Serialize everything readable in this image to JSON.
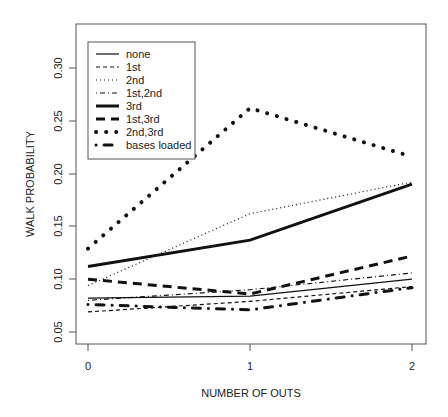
{
  "chart_data": {
    "type": "line",
    "title": "",
    "xlabel": "NUMBER OF OUTS",
    "ylabel": "WALK PROBABILITY",
    "x": [
      0,
      1,
      2
    ],
    "x_tick_labels": [
      "0",
      "1",
      "2"
    ],
    "y_ticks": [
      0.05,
      0.1,
      0.15,
      0.2,
      0.25,
      0.3
    ],
    "y_tick_labels": [
      "0.05",
      "0.10",
      "0.15",
      "0.20",
      "0.25",
      "0.30"
    ],
    "ylim": [
      0.04,
      0.34
    ],
    "xlim": [
      -0.07,
      2.09
    ],
    "grid": false,
    "legend_position": "top-left",
    "series": [
      {
        "name": "none",
        "style": "solid",
        "width": 1.2,
        "values": [
          0.082,
          0.084,
          0.1
        ]
      },
      {
        "name": "1st",
        "style": "dashed",
        "width": 1.2,
        "values": [
          0.069,
          0.079,
          0.093
        ]
      },
      {
        "name": "2nd",
        "style": "dotted",
        "width": 1.2,
        "values": [
          0.094,
          0.162,
          0.192
        ]
      },
      {
        "name": "1st,2nd",
        "style": "dotdash",
        "width": 1.2,
        "values": [
          0.08,
          0.09,
          0.106
        ]
      },
      {
        "name": "3rd",
        "style": "solid",
        "width": 3,
        "values": [
          0.112,
          0.137,
          0.19
        ]
      },
      {
        "name": "1st,3rd",
        "style": "longdash",
        "width": 3,
        "values": [
          0.1,
          0.086,
          0.122
        ]
      },
      {
        "name": "2nd,3rd",
        "style": "dotted-thick",
        "width": 3,
        "values": [
          0.129,
          0.262,
          0.216
        ]
      },
      {
        "name": "bases loaded",
        "style": "dot-longdash-thick",
        "width": 3,
        "values": [
          0.076,
          0.071,
          0.092
        ]
      }
    ]
  },
  "legend": {
    "items": [
      "none",
      "1st",
      "2nd",
      "1st,2nd",
      "3rd",
      "1st,3rd",
      "2nd,3rd",
      "bases loaded"
    ]
  },
  "colors": {
    "line": "#111111",
    "frame": "#555555",
    "text": "#222222"
  }
}
